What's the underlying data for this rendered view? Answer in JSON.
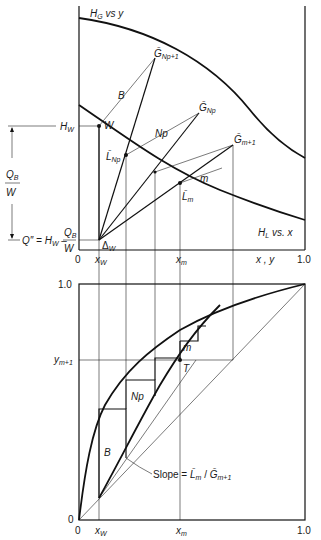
{
  "figure": {
    "top_panel": {
      "title_curve_upper": "H_G vs y",
      "curve_upper_label": {
        "main": "H",
        "sub": "G",
        "rest": " vs y"
      },
      "curve_lower_label": {
        "main": "H",
        "sub": "L",
        "rest": " vs. x"
      },
      "x_axis": {
        "label": "x , y",
        "tick_0": "0",
        "tick_xw": "x",
        "tick_xw_sub": "W",
        "tick_xm": "x",
        "tick_xm_sub": "m",
        "tick_1": "1.0"
      },
      "left_annotations": {
        "hw": {
          "main": "H",
          "sub": "W"
        },
        "qb_over_w": {
          "num": "Q",
          "num_sub": "B",
          "den": "W"
        },
        "q_double_prime": {
          "text": "Q″ = H",
          "sub": "W",
          "minus": " – ",
          "num": "Q",
          "num_sub": "B",
          "den": "W"
        }
      },
      "points": {
        "W": "W",
        "delta_w": {
          "main": "Δ",
          "sub": "W"
        },
        "G_Np_plus_1": {
          "main": "Ḡ",
          "sub": "Np+1"
        },
        "G_Np": {
          "main": "Ḡ",
          "sub": "Np"
        },
        "G_m_plus_1": {
          "main": "Ḡ",
          "sub": "m+1"
        },
        "L_Np": {
          "main": "L̄",
          "sub": "Np"
        },
        "L_m": {
          "main": "L̄",
          "sub": "m"
        }
      },
      "line_labels": {
        "B": "B",
        "Np": "Np",
        "m": "m"
      }
    },
    "bottom_panel": {
      "y_axis": {
        "tick_0": "0",
        "tick_1": "1.0",
        "tick_ym1": "y",
        "tick_ym1_sub": "m+1"
      },
      "x_axis": {
        "tick_0": "0",
        "tick_xw": "x",
        "tick_xw_sub": "W",
        "tick_xm": "x",
        "tick_xm_sub": "m",
        "tick_1": "1.0"
      },
      "stage_labels": {
        "B": "B",
        "Np": "Np",
        "m": "m",
        "T": "T"
      },
      "slope_label": {
        "prefix": "Slope = ",
        "num": "L̄",
        "num_sub": "m",
        "sep": " / ",
        "den": "Ḡ",
        "den_sub": "m+1"
      }
    }
  }
}
